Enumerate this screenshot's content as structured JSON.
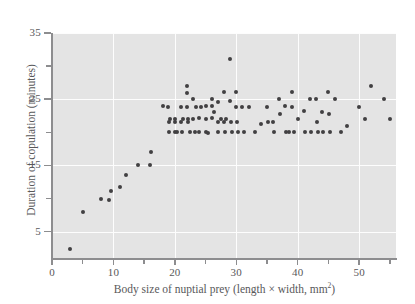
{
  "chart_data": {
    "type": "scatter",
    "title": "",
    "xlabel": "Body size of nuptial prey (length × width, mm²)",
    "xlabel_main": "Body size of nuptial prey (length × width, mm",
    "xlabel_sup": "2",
    "xlabel_tail": ")",
    "ylabel": "Duration of copulation (minutes)",
    "xlim": [
      0,
      56
    ],
    "ylim": [
      1,
      35
    ],
    "grid": true,
    "legend": null,
    "marker_color": "#414042",
    "plot_background": "#e4e4e4",
    "gridline_color": "#fdfdfd",
    "axis_color": "#8d8d8f",
    "x_ticks_major": [
      0,
      10,
      20,
      30,
      40,
      50
    ],
    "x_ticks_minor": [
      5,
      15,
      25,
      35,
      45,
      55
    ],
    "x_tick_labels": [
      "0",
      "10",
      "20",
      "30",
      "40",
      "50"
    ],
    "y_ticks_major": [
      5,
      15,
      25,
      35
    ],
    "y_ticks_minor": [
      10,
      20,
      30
    ],
    "y_tick_labels": [
      "5",
      "15",
      "25",
      "35"
    ],
    "points": [
      [
        3.0,
        2.3
      ],
      [
        5.0,
        8.0
      ],
      [
        8.0,
        9.9
      ],
      [
        9.2,
        9.8
      ],
      [
        9.6,
        11.2
      ],
      [
        11.0,
        11.8
      ],
      [
        12.0,
        13.6
      ],
      [
        14.0,
        15.0
      ],
      [
        16.0,
        15.0
      ],
      [
        16.1,
        17.0
      ],
      [
        18.0,
        23.9
      ],
      [
        18.9,
        23.8
      ],
      [
        19.0,
        21.5
      ],
      [
        19.0,
        20.0
      ],
      [
        19.2,
        22.0
      ],
      [
        20.0,
        21.6
      ],
      [
        20.0,
        20.0
      ],
      [
        20.1,
        22.0
      ],
      [
        20.3,
        20.0
      ],
      [
        21.0,
        21.6
      ],
      [
        21.0,
        23.8
      ],
      [
        21.1,
        20.0
      ],
      [
        21.4,
        22.0
      ],
      [
        22.0,
        27.0
      ],
      [
        22.0,
        26.0
      ],
      [
        22.0,
        23.8
      ],
      [
        22.1,
        22.0
      ],
      [
        22.2,
        21.5
      ],
      [
        22.4,
        20.0
      ],
      [
        23.0,
        25.0
      ],
      [
        23.0,
        22.0
      ],
      [
        23.2,
        20.1
      ],
      [
        23.5,
        23.8
      ],
      [
        24.0,
        22.2
      ],
      [
        24.0,
        20.0
      ],
      [
        24.2,
        23.8
      ],
      [
        25.0,
        23.9
      ],
      [
        25.0,
        22.0
      ],
      [
        25.1,
        20.0
      ],
      [
        25.4,
        19.9
      ],
      [
        26.0,
        25.0
      ],
      [
        26.0,
        23.9
      ],
      [
        26.1,
        22.1
      ],
      [
        26.4,
        23.0
      ],
      [
        27.0,
        24.6
      ],
      [
        27.0,
        21.5
      ],
      [
        27.1,
        20.0
      ],
      [
        27.5,
        22.0
      ],
      [
        28.0,
        26.1
      ],
      [
        28.0,
        21.6
      ],
      [
        28.1,
        20.0
      ],
      [
        28.4,
        22.0
      ],
      [
        29.0,
        31.0
      ],
      [
        29.0,
        24.7
      ],
      [
        29.1,
        21.6
      ],
      [
        29.3,
        20.1
      ],
      [
        30.0,
        26.1
      ],
      [
        30.0,
        23.8
      ],
      [
        30.1,
        21.5
      ],
      [
        30.2,
        20.0
      ],
      [
        31.0,
        23.8
      ],
      [
        31.2,
        20.0
      ],
      [
        32.0,
        23.8
      ],
      [
        33.0,
        20.0
      ],
      [
        34.0,
        21.2
      ],
      [
        35.0,
        23.8
      ],
      [
        35.1,
        21.6
      ],
      [
        36.0,
        21.6
      ],
      [
        36.2,
        20.1
      ],
      [
        37.0,
        25.0
      ],
      [
        37.1,
        22.8
      ],
      [
        38.0,
        23.9
      ],
      [
        38.1,
        20.0
      ],
      [
        38.6,
        20.0
      ],
      [
        39.0,
        26.1
      ],
      [
        39.1,
        23.8
      ],
      [
        39.4,
        20.1
      ],
      [
        40.0,
        22.0
      ],
      [
        41.0,
        23.2
      ],
      [
        41.2,
        20.0
      ],
      [
        42.0,
        25.0
      ],
      [
        42.1,
        20.0
      ],
      [
        43.0,
        25.0
      ],
      [
        43.1,
        21.6
      ],
      [
        43.3,
        20.0
      ],
      [
        44.0,
        23.0
      ],
      [
        44.1,
        20.0
      ],
      [
        45.0,
        26.1
      ],
      [
        45.1,
        22.8
      ],
      [
        45.2,
        20.0
      ],
      [
        46.0,
        25.0
      ],
      [
        47.0,
        20.0
      ],
      [
        48.0,
        21.0
      ],
      [
        50.0,
        23.8
      ],
      [
        51.0,
        22.0
      ],
      [
        52.0,
        27.0
      ],
      [
        54.0,
        25.0
      ],
      [
        55.0,
        22.0
      ]
    ]
  }
}
